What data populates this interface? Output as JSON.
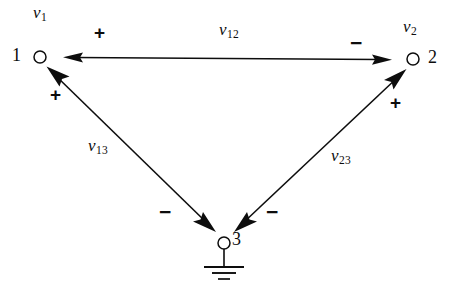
{
  "figure": {
    "type": "circuit-node-voltage-diagram",
    "ink_color": "#0d0d0d",
    "background_color": "#ffffff"
  },
  "nodes": [
    {
      "id": "1",
      "label": "1",
      "voltage_label": "v",
      "voltage_sub": "1",
      "cx": 40,
      "cy": 57
    },
    {
      "id": "2",
      "label": "2",
      "voltage_label": "v",
      "voltage_sub": "2",
      "cx": 413,
      "cy": 59
    },
    {
      "id": "3",
      "label": "3",
      "voltage_label": "",
      "voltage_sub": "",
      "cx": 224,
      "cy": 243
    }
  ],
  "branches": [
    {
      "name": "v12",
      "var": "v",
      "sub": "12",
      "from": "1",
      "to": "2",
      "plus_at": "1",
      "minus_at": "2"
    },
    {
      "name": "v13",
      "var": "v",
      "sub": "13",
      "from": "1",
      "to": "3",
      "plus_at": "1",
      "minus_at": "3"
    },
    {
      "name": "v23",
      "var": "v",
      "sub": "23",
      "from": "2",
      "to": "3",
      "plus_at": "2",
      "minus_at": "3"
    }
  ],
  "labels": {
    "node1_number": "1",
    "node2_number": "2",
    "node3_number": "3",
    "v1_var": "v",
    "v1_sub": "1",
    "v2_var": "v",
    "v2_sub": "2",
    "v12_var": "v",
    "v12_sub": "12",
    "v13_var": "v",
    "v13_sub": "13",
    "v23_var": "v",
    "v23_sub": "23",
    "plus_top_left": "+",
    "minus_top_right": "−",
    "plus_left_branch": "+",
    "plus_right_branch": "+",
    "minus_bottom_left": "−",
    "minus_bottom_right": "−"
  },
  "ground": {
    "present": true,
    "at_node": "3",
    "bar_widths": [
      40,
      24,
      12
    ]
  }
}
